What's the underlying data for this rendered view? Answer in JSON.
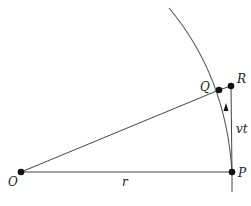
{
  "diagram": {
    "type": "geometry",
    "points": [
      {
        "id": "O",
        "label": "O",
        "x": 21,
        "y": 172
      },
      {
        "id": "P",
        "label": "P",
        "x": 232,
        "y": 172
      },
      {
        "id": "Q",
        "label": "Q",
        "x": 219,
        "y": 90
      },
      {
        "id": "R",
        "label": "R",
        "x": 231,
        "y": 86
      }
    ],
    "segments": [
      {
        "from": "O",
        "to": "P",
        "label": "r"
      },
      {
        "from": "O",
        "to": "Q",
        "label": ""
      },
      {
        "from": "Q",
        "to": "R",
        "label": ""
      },
      {
        "from": "P",
        "to": "R",
        "label": "vt"
      }
    ],
    "arc": {
      "description": "circular path through P and Q",
      "arrow_direction": "upward (P toward Q)"
    },
    "labels": {
      "O": "O",
      "P": "P",
      "Q": "Q",
      "R": "R",
      "r": "r",
      "vt": "vt"
    }
  }
}
